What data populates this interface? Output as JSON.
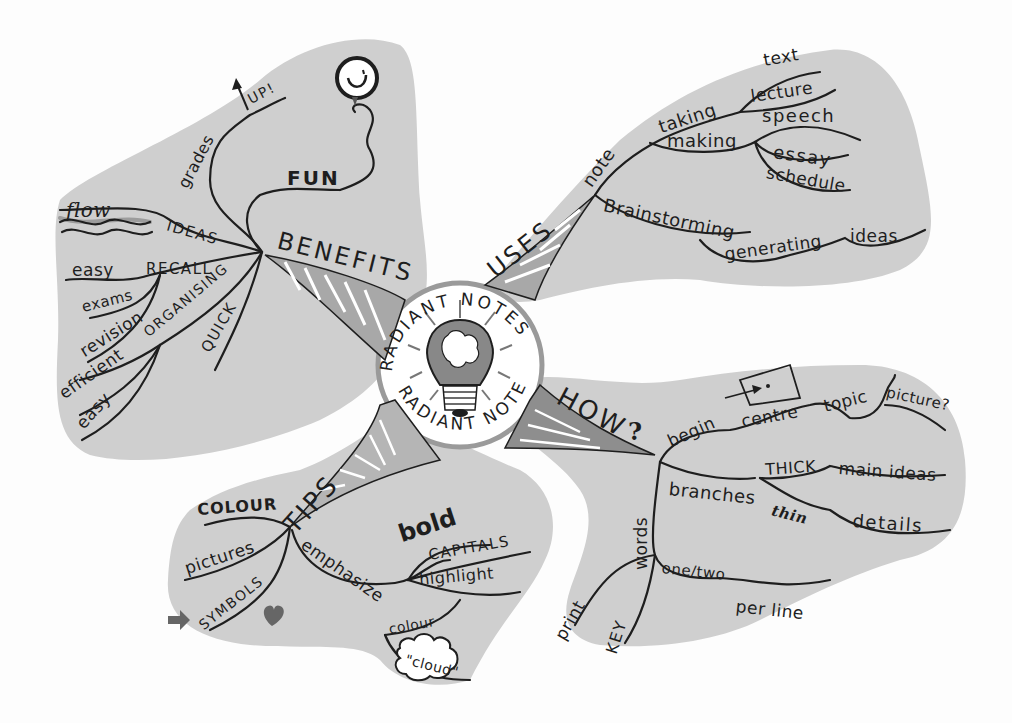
{
  "center": {
    "title_top": "RADIANT NOTES",
    "title_bottom": "RADIANT NOTES",
    "icon": "lightbulb-brain-icon"
  },
  "branches": {
    "benefits": {
      "label": "BENEFITS",
      "children": {
        "fun": "FUN",
        "grades": "grades",
        "up": "UP!",
        "flow": "flow",
        "ideas": "IDEAS",
        "easy1": "easy",
        "recall": "RECALL",
        "exams": "exams",
        "revision": "revision",
        "organising": "ORGANISING",
        "efficient": "efficient",
        "easy2": "easy",
        "quick": "QUICK"
      },
      "icons": [
        "balloon-smiley-icon",
        "arrow-up-icon",
        "waves-icon"
      ]
    },
    "uses": {
      "label": "USES",
      "children": {
        "note": "note",
        "taking": "taking",
        "making": "making",
        "text": "text",
        "lecture": "lecture",
        "speech": "speech",
        "essay": "essay",
        "schedule": "schedule",
        "brainstorming": "Brainstorming",
        "generating": "generating",
        "ideas": "ideas"
      }
    },
    "how": {
      "label": "HOW",
      "question": "?",
      "children": {
        "begin": "begin",
        "centre": "centre",
        "topic": "topic",
        "picture": "picture?",
        "branches": "branches",
        "thick": "THICK",
        "main_ideas": "main ideas",
        "thin": "thin",
        "details": "details",
        "words": "words",
        "one_two": "one/two",
        "per_line": "per line",
        "print": "print",
        "key": "KEY"
      },
      "icons": [
        "box-target-icon"
      ]
    },
    "tips": {
      "label": "TIPS",
      "children": {
        "colour1": "COLOUR",
        "pictures": "pictures",
        "symbols": "SYMBOLS",
        "emphasize": "emphasize",
        "bold": "bold",
        "capitals": "CAPITALS",
        "highlight": "highlight",
        "colour2": "colour",
        "cloud": "\"cloud\""
      },
      "icons": [
        "arrow-right-icon",
        "heart-icon",
        "cloud-icon"
      ]
    }
  },
  "colors": {
    "background": "#fdfdfd",
    "blob": "#cfcfcf",
    "ink": "#1e1e1e",
    "shade": "#7a7a7a"
  }
}
